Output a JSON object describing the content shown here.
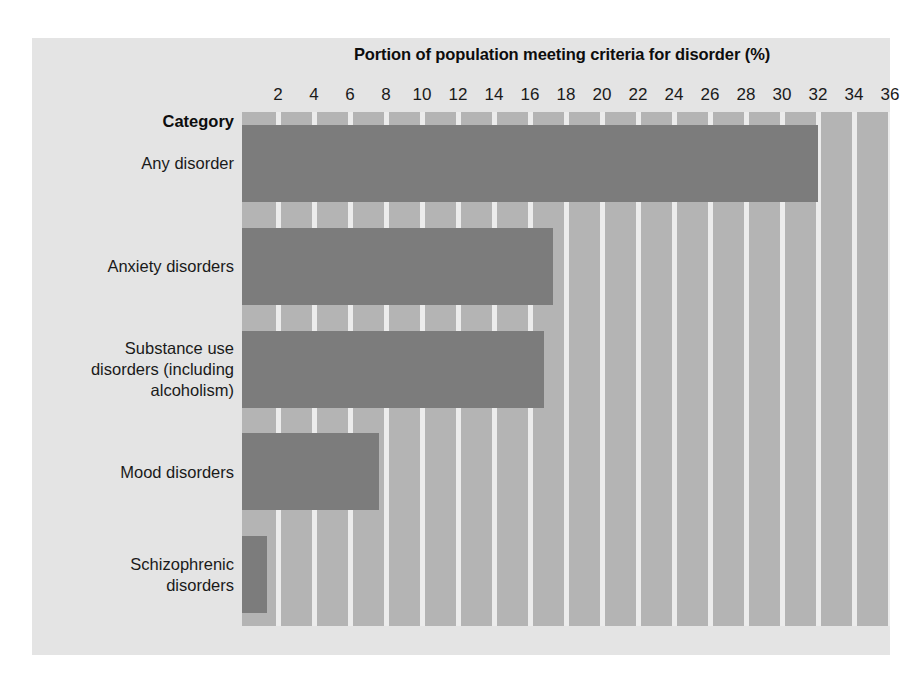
{
  "chart_data": {
    "type": "bar",
    "orientation": "horizontal",
    "title": "Portion of population meeting criteria for disorder (%)",
    "xlabel": "Portion of population meeting criteria for disorder (%)",
    "ylabel": "Category",
    "categories": [
      "Any disorder",
      "Anxiety disorders",
      "Substance use disorders (including alcoholism)",
      "Mood disorders",
      "Schizophrenic disorders"
    ],
    "values": [
      32.0,
      17.3,
      16.8,
      7.6,
      1.4
    ],
    "xlim": [
      0,
      36
    ],
    "xticks": [
      2,
      4,
      6,
      8,
      10,
      12,
      14,
      16,
      18,
      20,
      22,
      24,
      26,
      28,
      30,
      32,
      34,
      36
    ],
    "grid": true,
    "legend": null,
    "colors": {
      "bar_fill": "#7c7c7c",
      "plot_background": "#b4b4b4",
      "gridline": "#ececec",
      "card_background": "#e4e4e4",
      "text": "#1a1a1a"
    }
  },
  "axis": {
    "title": "Portion of population meeting criteria for disorder (%)",
    "category_header": "Category",
    "tick_labels": [
      "2",
      "4",
      "6",
      "8",
      "10",
      "12",
      "14",
      "16",
      "18",
      "20",
      "22",
      "24",
      "26",
      "28",
      "30",
      "32",
      "34",
      "36"
    ]
  },
  "category_labels": [
    {
      "lines": [
        "Any disorder"
      ]
    },
    {
      "lines": [
        "Anxiety disorders"
      ]
    },
    {
      "lines": [
        "Substance use",
        "disorders (including",
        "alcoholism)"
      ]
    },
    {
      "lines": [
        "Mood disorders"
      ]
    },
    {
      "lines": [
        "Schizophrenic",
        "disorders"
      ]
    }
  ]
}
